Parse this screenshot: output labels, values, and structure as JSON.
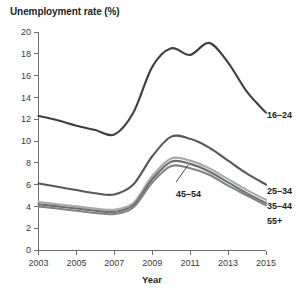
{
  "chart_data": {
    "type": "line",
    "title": "Unemployment rate (%)",
    "xlabel": "Year",
    "ylabel": "",
    "xlim": [
      2003,
      2015
    ],
    "ylim": [
      0,
      20
    ],
    "grid": false,
    "legend_position": "right-of-line-ends",
    "xticks": [
      "2003",
      "2005",
      "2007",
      "2009",
      "2011",
      "2013",
      "2015"
    ],
    "xtick_values": [
      2003,
      2005,
      2007,
      2009,
      2011,
      2013,
      2015
    ],
    "yticks": [
      "0",
      "2",
      "4",
      "6",
      "8",
      "10",
      "12",
      "14",
      "16",
      "18",
      "20"
    ],
    "ytick_values": [
      0,
      2,
      4,
      6,
      8,
      10,
      12,
      14,
      16,
      18,
      20
    ],
    "x": [
      2003,
      2004,
      2005,
      2006,
      2007,
      2008,
      2009,
      2010,
      2011,
      2012,
      2013,
      2014,
      2015
    ],
    "series": [
      {
        "name": "16-24",
        "label": "16–24",
        "color": "#3f3f3f",
        "values": [
          12.3,
          11.9,
          11.4,
          11.0,
          10.6,
          12.6,
          16.8,
          18.5,
          17.9,
          19.0,
          17.2,
          14.5,
          12.6
        ]
      },
      {
        "name": "25-34",
        "label": "25–34",
        "color": "#58585a",
        "values": [
          6.1,
          5.8,
          5.5,
          5.2,
          5.1,
          6.0,
          8.6,
          10.4,
          10.2,
          9.4,
          8.2,
          7.0,
          6.0
        ]
      },
      {
        "name": "35-44",
        "label": "35–44",
        "color": "#a7a9ac",
        "values": [
          4.4,
          4.2,
          4.0,
          3.8,
          3.7,
          4.3,
          6.8,
          8.4,
          8.2,
          7.5,
          6.5,
          5.5,
          4.6
        ]
      },
      {
        "name": "45-54",
        "label": "45–54",
        "color": "#6d6e70",
        "values": [
          4.2,
          4.0,
          3.8,
          3.6,
          3.5,
          4.1,
          6.5,
          8.1,
          7.9,
          7.2,
          6.2,
          5.2,
          4.3
        ]
      },
      {
        "name": "55+",
        "label": "55+",
        "color": "#808285",
        "values": [
          4.0,
          3.8,
          3.6,
          3.4,
          3.3,
          3.9,
          6.2,
          7.7,
          7.5,
          6.9,
          5.9,
          5.0,
          4.1
        ]
      }
    ],
    "annotations": [
      {
        "text": "45–54",
        "target_series": "45-54",
        "target_x": 2011,
        "leader_line": true
      }
    ]
  },
  "labels": {
    "title": "Unemployment rate (%)",
    "xlabel": "Year",
    "s16_24": "16–24",
    "s25_34": "25–34",
    "s35_44": "35–44",
    "s45_54": "45–54",
    "s55plus": "55+",
    "y0": "0",
    "y2": "2",
    "y4": "4",
    "y6": "6",
    "y8": "8",
    "y10": "10",
    "y12": "12",
    "y14": "14",
    "y16": "16",
    "y18": "18",
    "y20": "20",
    "x2003": "2003",
    "x2005": "2005",
    "x2007": "2007",
    "x2009": "2009",
    "x2011": "2011",
    "x2013": "2013",
    "x2015": "2015"
  }
}
